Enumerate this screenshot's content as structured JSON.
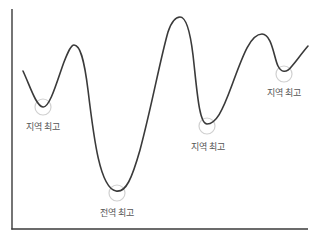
{
  "diagram": {
    "title": "",
    "type": "loss-landscape",
    "colors": {
      "axis": "#3a3a3a",
      "curve": "#3a3a3a",
      "highlight_circle": "#d0d0d0",
      "label": "#555555",
      "background": "#ffffff"
    },
    "labels": [
      {
        "id": "local-1",
        "text": "지역 최고",
        "x": 43,
        "y": 120
      },
      {
        "id": "global",
        "text": "전역 최고",
        "x": 117,
        "y": 205
      },
      {
        "id": "local-2",
        "text": "지역 최고",
        "x": 208,
        "y": 138
      },
      {
        "id": "local-3",
        "text": "지역 최고",
        "x": 284,
        "y": 86
      }
    ],
    "minima": [
      {
        "id": "local-1",
        "type": "local",
        "x": 43,
        "y": 107
      },
      {
        "id": "global",
        "type": "global",
        "x": 117,
        "y": 191
      },
      {
        "id": "local-2",
        "type": "local",
        "x": 206,
        "y": 124
      },
      {
        "id": "local-3",
        "type": "local",
        "x": 283,
        "y": 72
      }
    ],
    "peaks": [
      {
        "x": 74,
        "y": 45
      },
      {
        "x": 180,
        "y": 17
      },
      {
        "x": 263,
        "y": 34
      }
    ],
    "axes": {
      "y_axis": {
        "x": 12,
        "y_top": 9,
        "y_bottom": 229
      },
      "x_axis": {
        "y": 229,
        "x_left": 12,
        "x_right": 308
      }
    }
  }
}
